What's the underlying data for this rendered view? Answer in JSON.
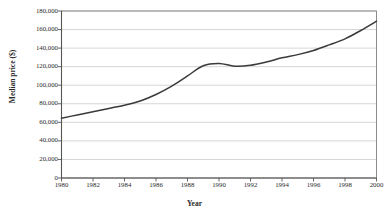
{
  "chart_data": {
    "type": "line",
    "title": "",
    "xlabel": "Year",
    "ylabel": "Median price ($)",
    "xlim": [
      1980,
      2000
    ],
    "ylim": [
      0,
      180000
    ],
    "xticks": [
      "1980",
      "1982",
      "1984",
      "1986",
      "1988",
      "1990",
      "1992",
      "1994",
      "1996",
      "1998",
      "2000"
    ],
    "xtick_values": [
      1980,
      1982,
      1984,
      1986,
      1988,
      1990,
      1992,
      1994,
      1996,
      1998,
      2000
    ],
    "yticks": [
      "0",
      "20,000",
      "40,000",
      "60,000",
      "80,000",
      "100,000",
      "120,000",
      "140,000",
      "160,000",
      "180,000"
    ],
    "ytick_values": [
      0,
      20000,
      40000,
      60000,
      80000,
      100000,
      120000,
      140000,
      160000,
      180000
    ],
    "grid": "horizontal",
    "legend": "none",
    "series": [
      {
        "name": "Median price",
        "color": "#3a3a3a",
        "x": [
          1980,
          1981,
          1982,
          1983,
          1984,
          1985,
          1986,
          1987,
          1988,
          1989,
          1990,
          1991,
          1992,
          1993,
          1994,
          1995,
          1996,
          1997,
          1998,
          1999,
          2000
        ],
        "values": [
          64500,
          68000,
          71500,
          75000,
          78500,
          83000,
          90000,
          99000,
          110000,
          121000,
          123500,
          120500,
          121500,
          125000,
          129500,
          133000,
          137500,
          143500,
          150000,
          159000,
          169000
        ]
      }
    ]
  },
  "axis_colors": {
    "grid": "#cccccc",
    "frame": "#808080",
    "line": "#3a3a3a",
    "text": "#2b2b2b"
  }
}
